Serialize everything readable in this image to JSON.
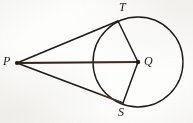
{
  "figure": {
    "type": "geometry-diagram",
    "background_color": "#fdfdfb",
    "stroke_color": "#1f1c1a",
    "accent_color": "#7a3b2e",
    "canvas": {
      "width": 193,
      "height": 123
    },
    "circle": {
      "label": "circle-Q",
      "center_x": 138,
      "center_y": 62,
      "radius": 45,
      "stroke_color": "#1f1c1a",
      "stroke_width": 1.4
    },
    "points": [
      {
        "id": "P",
        "label": "P",
        "x": 17,
        "y": 63,
        "label_x": 3,
        "label_y": 55,
        "marked": true,
        "role": "external-point"
      },
      {
        "id": "Q",
        "label": "Q",
        "x": 138,
        "y": 62,
        "label_x": 144,
        "label_y": 55,
        "marked": true,
        "role": "center"
      },
      {
        "id": "T",
        "label": "T",
        "x": 118,
        "y": 21,
        "label_x": 119,
        "label_y": 1,
        "marked": false,
        "role": "tangent-point-upper"
      },
      {
        "id": "S",
        "label": "S",
        "x": 123,
        "y": 103,
        "label_x": 118,
        "label_y": 106,
        "marked": false,
        "role": "tangent-point-lower"
      }
    ],
    "segments": [
      {
        "id": "PT",
        "from": "P",
        "to": "T",
        "x1": 17,
        "y1": 63,
        "x2": 118,
        "y2": 21,
        "color": "#1f1c1a",
        "width": 1.6,
        "kind": "tangent"
      },
      {
        "id": "PS",
        "from": "P",
        "to": "S",
        "x1": 17,
        "y1": 63,
        "x2": 123,
        "y2": 103,
        "color": "#1f1c1a",
        "width": 1.6,
        "kind": "tangent"
      },
      {
        "id": "PQ",
        "from": "P",
        "to": "Q",
        "x1": 17,
        "y1": 63,
        "x2": 138,
        "y2": 62,
        "color": "#39211b",
        "width": 1.8,
        "kind": "secant-through-center"
      },
      {
        "id": "QT",
        "from": "Q",
        "to": "T",
        "x1": 138,
        "y1": 62,
        "x2": 118,
        "y2": 21,
        "color": "#1f1c1a",
        "width": 1.5,
        "kind": "radius"
      },
      {
        "id": "QS",
        "from": "Q",
        "to": "S",
        "x1": 138,
        "y1": 62,
        "x2": 123,
        "y2": 103,
        "color": "#1f1c1a",
        "width": 1.5,
        "kind": "radius"
      }
    ],
    "labels": {
      "P": "P",
      "Q": "Q",
      "T": "T",
      "S": "S"
    }
  }
}
